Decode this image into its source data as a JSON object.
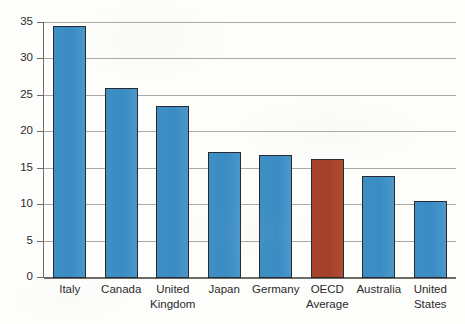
{
  "chart_data": {
    "type": "bar",
    "title": "",
    "subtitle": "",
    "xlabel": "",
    "ylabel": "",
    "categories": [
      "Italy",
      "Canada",
      "United Kingdom",
      "Japan",
      "Germany",
      "OECD Average",
      "Australia",
      "United States"
    ],
    "category_lines": [
      [
        "Italy"
      ],
      [
        "Canada"
      ],
      [
        "United",
        "Kingdom"
      ],
      [
        "Japan"
      ],
      [
        "Germany"
      ],
      [
        "OECD",
        "Average"
      ],
      [
        "Australia"
      ],
      [
        "United",
        "States"
      ]
    ],
    "values": [
      34.4,
      26.0,
      23.5,
      17.2,
      16.7,
      16.2,
      13.9,
      10.4
    ],
    "bar_colors": [
      "#3a8cc4",
      "#3a8cc4",
      "#3a8cc4",
      "#3a8cc4",
      "#3a8cc4",
      "#a8422b",
      "#3a8cc4",
      "#3a8cc4"
    ],
    "highlight_category": "OECD Average",
    "ylim": [
      0,
      35
    ],
    "ytick_step": 5,
    "ytick_labels": [
      "35",
      "30",
      "25",
      "20",
      "15",
      "10",
      "5",
      "0"
    ],
    "ytick_values": [
      35,
      30,
      25,
      20,
      15,
      10,
      5,
      0
    ],
    "grid": true,
    "grid_axis": "y",
    "legend": null,
    "legend_position": "none",
    "annotations": []
  },
  "style": {
    "background": "#fdfdfc",
    "grid_color": "#9a9a96",
    "axis_color": "#6d6d68",
    "bar_outline": "#2a2a2a",
    "text_color": "#2b2b2b",
    "accent_blue": "#3a8cc4",
    "accent_red": "#a8422b"
  }
}
